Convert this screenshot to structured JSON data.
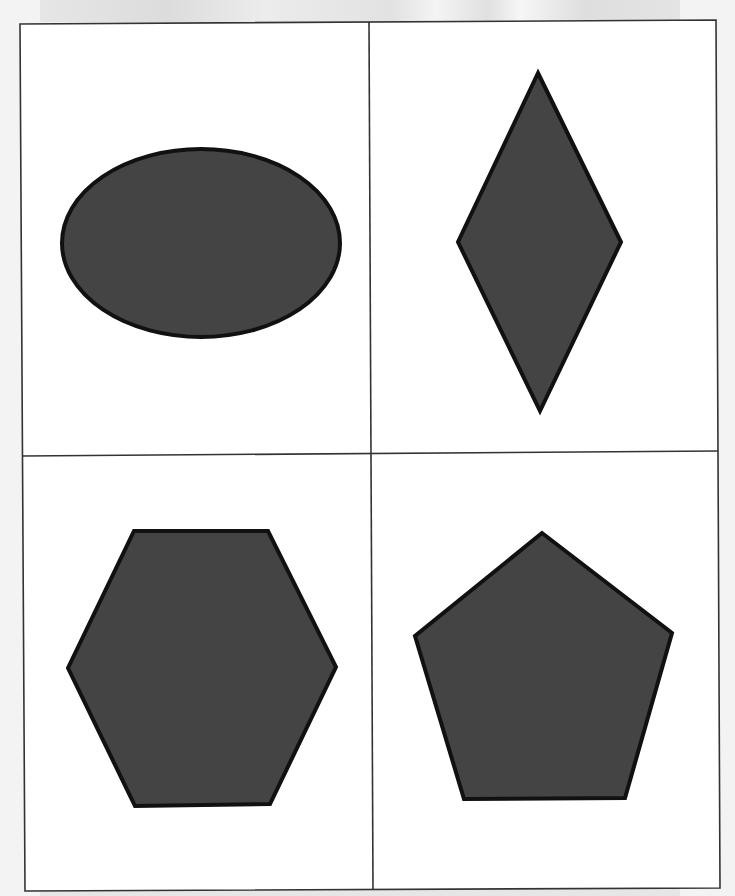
{
  "sheet": {
    "background": "#ffffff",
    "frame_color": "#333333",
    "grid": {
      "rows": 2,
      "cols": 2
    }
  },
  "colors": {
    "shape_fill": "#444444",
    "shape_stroke": "#111111",
    "scan_background": "#f3f3f3"
  },
  "shapes": [
    {
      "name": "ellipse",
      "cell": "top-left"
    },
    {
      "name": "diamond",
      "cell": "top-right"
    },
    {
      "name": "hexagon",
      "cell": "bottom-left"
    },
    {
      "name": "pentagon",
      "cell": "bottom-right"
    }
  ]
}
